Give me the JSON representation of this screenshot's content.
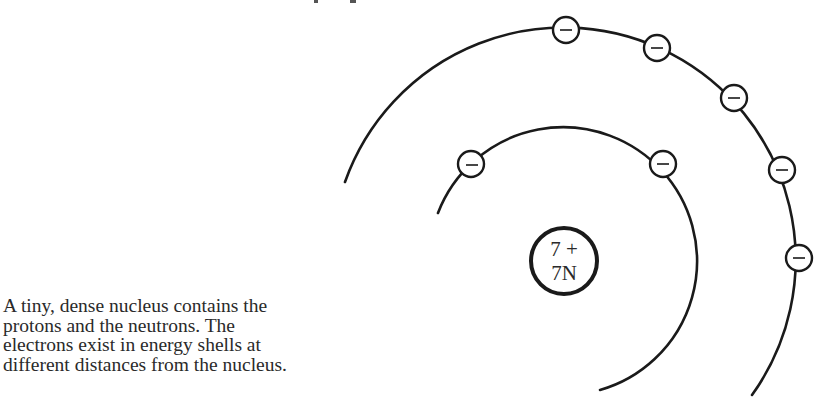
{
  "diagram": {
    "nucleus": {
      "line1": "7 +",
      "line2": "7N",
      "center": [
        564,
        261
      ],
      "radius": 34
    },
    "shells": [
      {
        "name": "inner-shell",
        "center": [
          567,
          260
        ],
        "radius": 134,
        "electron_count": 2,
        "electron_positions": [
          [
            471,
            164
          ],
          [
            663,
            164
          ]
        ]
      },
      {
        "name": "outer-shell",
        "center": [
          567,
          260
        ],
        "radius": 232,
        "electron_count": 5,
        "electron_positions": [
          [
            566,
            30
          ],
          [
            657,
            48
          ],
          [
            734,
            98
          ],
          [
            782,
            170
          ],
          [
            799,
            258
          ]
        ]
      }
    ],
    "electron_symbol": "−",
    "electron_radius": 13
  },
  "caption": {
    "lines": [
      "A tiny, dense nucleus contains the",
      "protons and the neutrons. The",
      "electrons exist in energy shells at",
      "different distances from the nucleus."
    ]
  },
  "colors": {
    "stroke": "#1a1a1a",
    "text": "#2a2a2a",
    "background": "#ffffff"
  }
}
